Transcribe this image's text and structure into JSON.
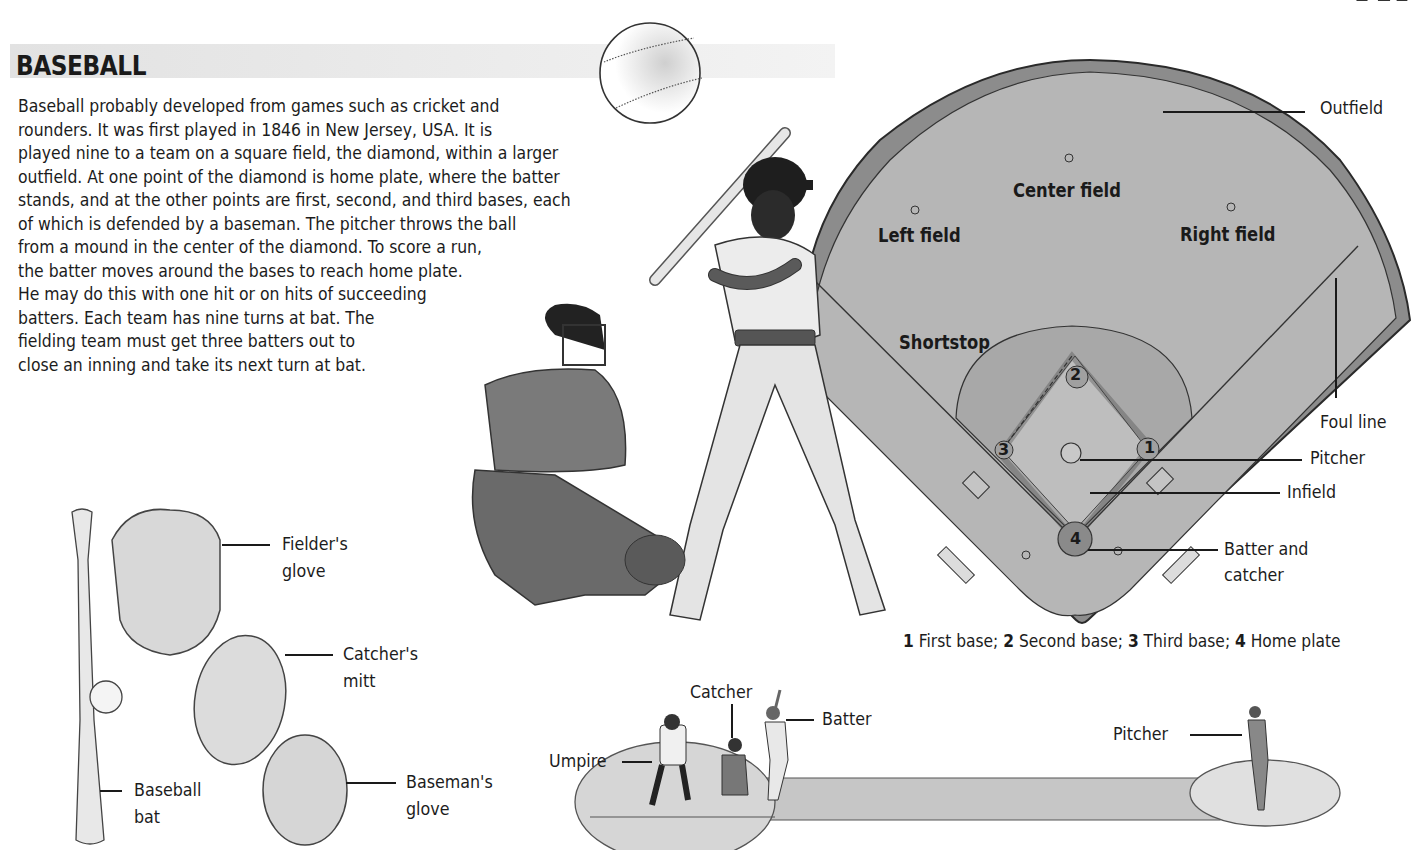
{
  "section": {
    "title": "BASEBALL",
    "intro_lines": [
      "Baseball probably developed from games such as cricket and",
      "rounders. It was first played in 1846 in New Jersey, USA. It is",
      "played nine to a team on a square field, the diamond, within a larger",
      "outfield. At one point of the diamond is home plate, where the batter",
      "stands, and at the other points are first, second, and third bases, each",
      "of which is defended by a baseman. The pitcher throws the ball",
      "from a mound in the center of the diamond. To score a run,",
      "the batter moves around the bases to reach home plate.",
      "He may do this with one hit or on hits of succeeding",
      "batters. Each team has nine turns at bat. The",
      "fielding team must get three batters out to",
      "close an inning and take its next turn at bat."
    ]
  },
  "field_diagram": {
    "position_labels": {
      "center_field": "Center field",
      "left_field": "Left field",
      "right_field": "Right field",
      "shortstop": "Shortstop"
    },
    "callouts": {
      "outfield": "Outfield",
      "foul_line": "Foul line",
      "pitcher": "Pitcher",
      "infield": "Infield",
      "batter_and_catcher_line1": "Batter and",
      "batter_and_catcher_line2": "catcher"
    },
    "base_numbers": [
      "1",
      "2",
      "3",
      "4"
    ],
    "legend": [
      {
        "num": "1",
        "text": " First base; "
      },
      {
        "num": "2",
        "text": " Second base; "
      },
      {
        "num": "3",
        "text": " Third base; "
      },
      {
        "num": "4",
        "text": " Home plate"
      }
    ],
    "colors": {
      "field": "#b4b4b4",
      "infield_arc": "#a6a6a6",
      "warning_track": "#8c8c8c",
      "outline": "#2a2a2a"
    }
  },
  "equipment": {
    "fielders_glove": [
      "Fielder's",
      "glove"
    ],
    "catchers_mitt": [
      "Catcher's",
      "mitt"
    ],
    "basemans_glove": [
      "Baseman's",
      "glove"
    ],
    "baseball_bat": [
      "Baseball",
      "bat"
    ]
  },
  "pitch_diagram": {
    "catcher": "Catcher",
    "batter": "Batter",
    "umpire": "Umpire",
    "pitcher": "Pitcher"
  }
}
